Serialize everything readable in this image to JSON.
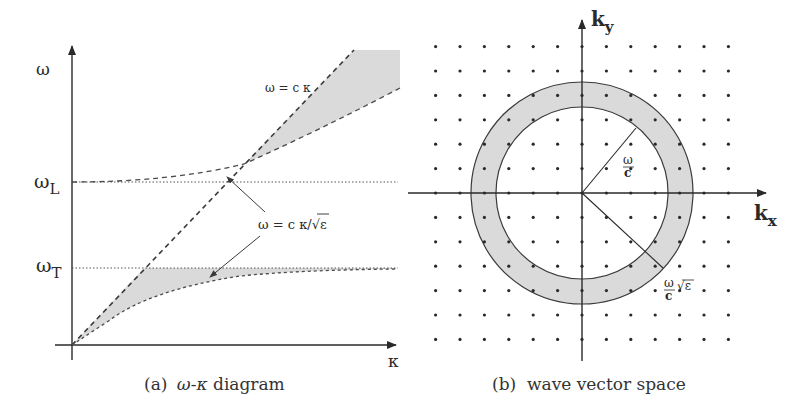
{
  "panel_a": {
    "caption_prefix": "(a)",
    "caption_omega": "ω",
    "caption_dash": "-",
    "caption_kappa": "κ",
    "caption_rest": " diagram",
    "y_axis_label": "ω",
    "x_axis_label": "κ",
    "omega_L_main": "ω",
    "omega_L_sub": "L",
    "omega_T_main": "ω",
    "omega_T_sub": "T",
    "light_line_label": "ω = c κ",
    "medium_line_label_prefix": "ω = c κ/",
    "medium_line_label_sqrt": "√ε",
    "shade_color": "#d9d9d9",
    "line_color": "#3a3a3a"
  },
  "panel_b": {
    "caption": "(b)  wave vector space",
    "ky_main": "k",
    "ky_sub": "y",
    "kx_main": "k",
    "kx_sub": "x",
    "inner_label_num": "ω",
    "inner_label_den": "c",
    "outer_label_num": "ω",
    "outer_label_den": "c",
    "outer_label_sqrt": "√ε",
    "ring_color": "#d9d9d9",
    "grid": {
      "columns": 13,
      "rows": 13,
      "spacing": 24.4
    }
  }
}
